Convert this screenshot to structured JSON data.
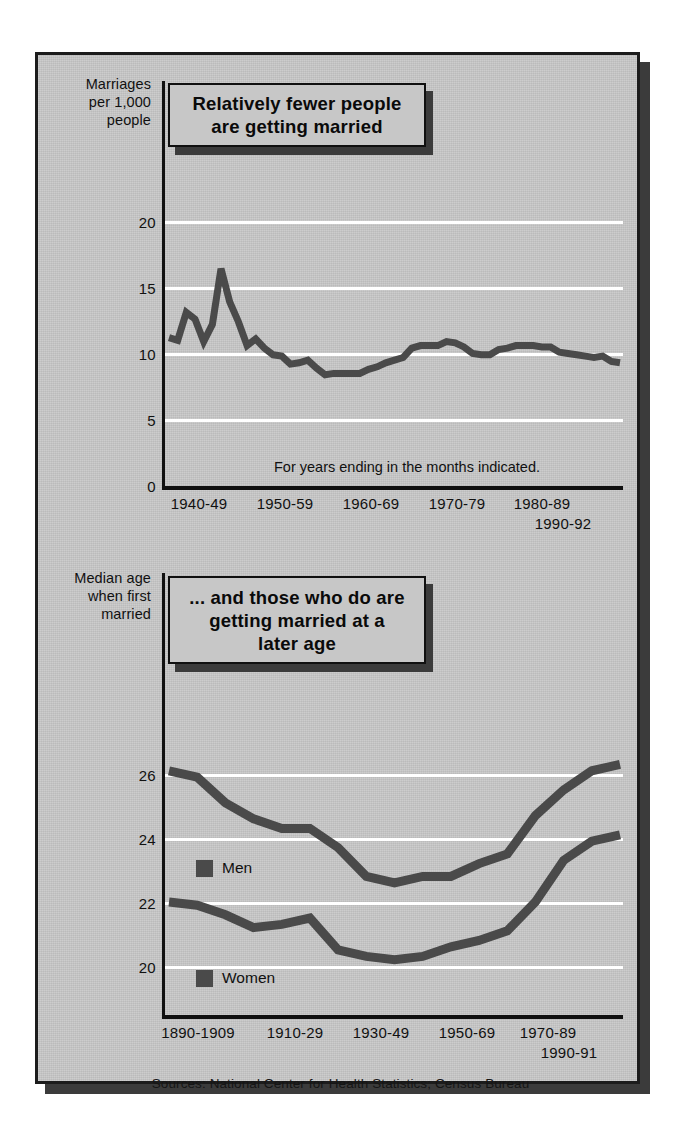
{
  "figure": {
    "background_color": "#c8c8c8",
    "frame_color": "#1c1c1c",
    "line_color": "#4a4a4a",
    "gridline_color": "#ffffff",
    "source_note": "Sources: National Center for Health Statistics; Census Bureau"
  },
  "top": {
    "axis_caption_line1": "Marriages",
    "axis_caption_line2": "per 1,000",
    "axis_caption_line3": "people",
    "title": "Relatively fewer people are getting married",
    "title_line1": "Relatively fewer people",
    "title_line2": "are getting married",
    "annotation": "For years ending in the months indicated."
  },
  "bottom": {
    "axis_caption_line1": "Median age",
    "axis_caption_line2": "when first",
    "axis_caption_line3": "married",
    "title": "... and those who do are getting married at a later age",
    "title_line1": "... and those who do are",
    "title_line2": "getting married at a",
    "title_line3": "later age",
    "legend_men": "Men",
    "legend_women": "Women"
  },
  "chart_data": [
    {
      "id": "marriage-rate",
      "type": "line",
      "title": "Relatively fewer people are getting married",
      "xlabel": "",
      "ylabel": "Marriages per 1,000 people",
      "annotation": "For years ending in the months indicated.",
      "ylim": [
        0,
        21
      ],
      "yticks": [
        0,
        5,
        10,
        15,
        20
      ],
      "grid": true,
      "grid_axis": "y",
      "xtick_labels": [
        "1940-49",
        "1950-59",
        "1960-69",
        "1970-79",
        "1980-89",
        "1990-92"
      ],
      "x": [
        1940,
        1941,
        1942,
        1943,
        1944,
        1945,
        1946,
        1947,
        1948,
        1949,
        1950,
        1951,
        1952,
        1953,
        1954,
        1955,
        1956,
        1957,
        1958,
        1959,
        1960,
        1961,
        1962,
        1963,
        1964,
        1965,
        1966,
        1967,
        1968,
        1969,
        1970,
        1971,
        1972,
        1973,
        1974,
        1975,
        1976,
        1977,
        1978,
        1979,
        1980,
        1981,
        1982,
        1983,
        1984,
        1985,
        1986,
        1987,
        1988,
        1989,
        1990,
        1991,
        1992
      ],
      "values": [
        11.2,
        11.0,
        13.1,
        12.6,
        10.9,
        12.2,
        16.4,
        13.9,
        12.4,
        10.6,
        11.1,
        10.4,
        9.9,
        9.8,
        9.2,
        9.3,
        9.5,
        8.9,
        8.4,
        8.5,
        8.5,
        8.5,
        8.5,
        8.8,
        9.0,
        9.3,
        9.5,
        9.7,
        10.4,
        10.6,
        10.6,
        10.6,
        10.9,
        10.8,
        10.5,
        10.0,
        9.9,
        9.9,
        10.3,
        10.4,
        10.6,
        10.6,
        10.6,
        10.5,
        10.5,
        10.1,
        10.0,
        9.9,
        9.8,
        9.7,
        9.8,
        9.4,
        9.3
      ],
      "series": [
        {
          "name": "Marriages per 1,000 people",
          "color": "#4a4a4a",
          "values": [
            11.2,
            11.0,
            13.1,
            12.6,
            10.9,
            12.2,
            16.4,
            13.9,
            12.4,
            10.6,
            11.1,
            10.4,
            9.9,
            9.8,
            9.2,
            9.3,
            9.5,
            8.9,
            8.4,
            8.5,
            8.5,
            8.5,
            8.5,
            8.8,
            9.0,
            9.3,
            9.5,
            9.7,
            10.4,
            10.6,
            10.6,
            10.6,
            10.9,
            10.8,
            10.5,
            10.0,
            9.9,
            9.9,
            10.3,
            10.4,
            10.6,
            10.6,
            10.6,
            10.5,
            10.5,
            10.1,
            10.0,
            9.9,
            9.8,
            9.7,
            9.8,
            9.4,
            9.3
          ]
        }
      ]
    },
    {
      "id": "median-age-first-marriage",
      "type": "line",
      "title": "... and those who do are getting married at a later age",
      "xlabel": "",
      "ylabel": "Median age when first married",
      "ylim": [
        19,
        26.8
      ],
      "yticks": [
        20,
        22,
        24,
        26
      ],
      "grid": true,
      "grid_axis": "y",
      "legend": [
        "Men",
        "Women"
      ],
      "legend_position": "inside-left",
      "xtick_labels": [
        "1890-1909",
        "1910-29",
        "1930-49",
        "1950-69",
        "1970-89",
        "1990-91"
      ],
      "x": [
        "1890",
        "1900",
        "1910",
        "1920",
        "1930",
        "1940",
        "1947",
        "1950",
        "1955",
        "1960",
        "1965",
        "1970",
        "1975",
        "1980",
        "1985",
        "1990",
        "1991"
      ],
      "series": [
        {
          "name": "Men",
          "color": "#4a4a4a",
          "values": [
            26.1,
            25.9,
            25.1,
            24.6,
            24.3,
            24.3,
            23.7,
            22.8,
            22.6,
            22.8,
            22.8,
            23.2,
            23.5,
            24.7,
            25.5,
            26.1,
            26.3
          ]
        },
        {
          "name": "Women",
          "color": "#4a4a4a",
          "values": [
            22.0,
            21.9,
            21.6,
            21.2,
            21.3,
            21.5,
            20.5,
            20.3,
            20.2,
            20.3,
            20.6,
            20.8,
            21.1,
            22.0,
            23.3,
            23.9,
            24.1
          ]
        }
      ]
    }
  ]
}
